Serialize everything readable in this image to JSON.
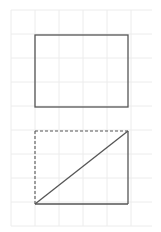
{
  "diagram": {
    "grid": {
      "x0": 11,
      "y0": 10,
      "x1": 152,
      "y1": 226,
      "spacing": 24,
      "color": "#ececec"
    },
    "shapes": {
      "top_rectangle": {
        "x": 35,
        "y": 35,
        "width": 93,
        "height": 72,
        "stroke": "#555555",
        "style": "solid"
      },
      "bottom_rectangle": {
        "x": 35,
        "y": 131,
        "width": 93,
        "height": 73,
        "stroke": "#555555",
        "solid_sides": [
          "right",
          "bottom"
        ],
        "dashed_sides": [
          "top",
          "left"
        ],
        "diagonal": {
          "from": "bottom-left",
          "to": "top-right"
        }
      }
    }
  }
}
